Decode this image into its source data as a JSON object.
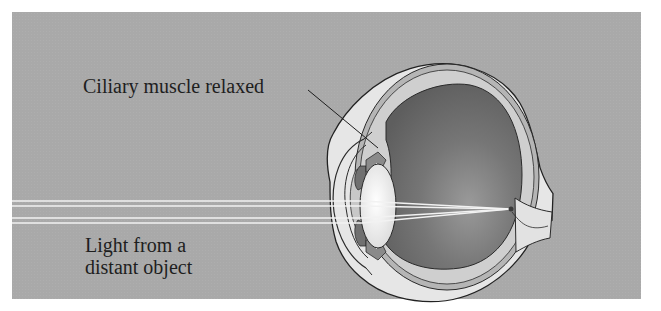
{
  "figure": {
    "labels": {
      "ciliary_muscle": "Ciliary muscle relaxed",
      "light_line1": "Light from a",
      "light_line2": "distant object"
    },
    "colors": {
      "background_panel": "#a9a9a9",
      "eye_interior": "#6e6e6e",
      "sclera": "#e8e8e8",
      "lens": "#f0f0f0",
      "outline": "#2a2a2a",
      "light_rays": "#f2f2f2"
    },
    "parts": [
      "cornea",
      "iris",
      "lens",
      "ciliary-muscle",
      "vitreous-humor",
      "retina",
      "choroid",
      "sclera",
      "optic-nerve",
      "light-rays",
      "focal-point"
    ]
  }
}
